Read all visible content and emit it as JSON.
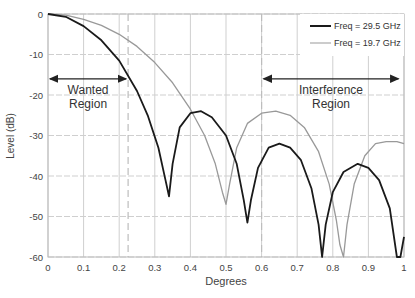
{
  "chart_data": {
    "type": "line",
    "title": "",
    "xlabel": "Degrees",
    "ylabel": "Level (dB)",
    "xlim": [
      0,
      1
    ],
    "ylim": [
      -60,
      0
    ],
    "x_ticks": [
      "0",
      "0.1",
      "0.2",
      "0.3",
      "0.4",
      "0.5",
      "0.6",
      "0.7",
      "0.8",
      "0.9",
      "1"
    ],
    "y_ticks": [
      "0",
      "-10",
      "-20",
      "-30",
      "-40",
      "-50",
      "-60"
    ],
    "grid": true,
    "legend_position": "top-right",
    "series": [
      {
        "name": "Freq = 29.5 GHz",
        "color": "#1a1a1a",
        "x": [
          0,
          0.05,
          0.1,
          0.15,
          0.2,
          0.25,
          0.28,
          0.31,
          0.33,
          0.34,
          0.35,
          0.37,
          0.4,
          0.43,
          0.46,
          0.5,
          0.53,
          0.55,
          0.56,
          0.57,
          0.59,
          0.62,
          0.65,
          0.68,
          0.71,
          0.74,
          0.76,
          0.77,
          0.78,
          0.8,
          0.83,
          0.87,
          0.9,
          0.93,
          0.96,
          0.98,
          0.99,
          1.0
        ],
        "values": [
          0,
          -0.7,
          -3,
          -6.5,
          -11.5,
          -19,
          -25,
          -33,
          -41,
          -45,
          -37,
          -28,
          -24.5,
          -24,
          -25.5,
          -30,
          -37,
          -46,
          -51.5,
          -46,
          -38,
          -33,
          -32,
          -33,
          -36,
          -43,
          -52,
          -60,
          -52,
          -44,
          -39,
          -37,
          -38,
          -41,
          -48,
          -60,
          -60,
          -55
        ]
      },
      {
        "name": "Freq = 19.7 GHz",
        "color": "#999999",
        "x": [
          0,
          0.05,
          0.1,
          0.15,
          0.2,
          0.25,
          0.3,
          0.35,
          0.4,
          0.44,
          0.47,
          0.49,
          0.5,
          0.51,
          0.53,
          0.56,
          0.6,
          0.64,
          0.68,
          0.72,
          0.76,
          0.79,
          0.81,
          0.82,
          0.83,
          0.84,
          0.86,
          0.89,
          0.92,
          0.95,
          0.98,
          1.0
        ],
        "values": [
          0,
          -0.3,
          -1.3,
          -2.8,
          -5,
          -8,
          -12,
          -17,
          -23.5,
          -30,
          -37,
          -44,
          -47,
          -42,
          -33,
          -27,
          -24.5,
          -24,
          -25,
          -28,
          -34,
          -42,
          -51,
          -57,
          -60,
          -52,
          -42,
          -35,
          -32,
          -31.5,
          -31.5,
          -32
        ]
      }
    ],
    "annotations": [
      {
        "text_line1": "Wanted",
        "text_line2": "Region",
        "x_range": [
          0,
          0.225
        ],
        "y": -16
      },
      {
        "text_line1": "Interference",
        "text_line2": "Region",
        "x_range": [
          0.6,
          0.99
        ],
        "y": -16
      }
    ],
    "reference_lines_x": [
      0.225,
      0.6
    ]
  }
}
